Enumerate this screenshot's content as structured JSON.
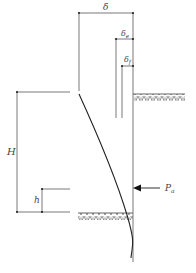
{
  "diagram": {
    "type": "retaining-wall-deflection",
    "labels": {
      "total_deflection": "δ",
      "elastic_deflection": "δ",
      "elastic_subscript": "e",
      "foundation_deflection": "δ",
      "foundation_subscript": "f",
      "wall_height": "H",
      "force_height": "h",
      "active_force": "P",
      "active_force_subscript": "a"
    },
    "colors": {
      "line": "#555555",
      "curve": "#222222",
      "hatch": "#666666",
      "text": "#444444"
    }
  }
}
